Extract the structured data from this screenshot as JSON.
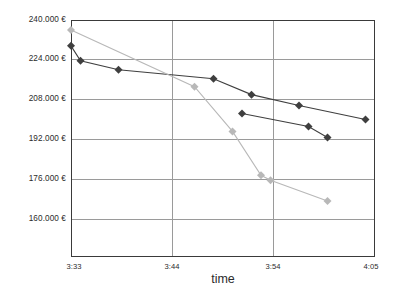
{
  "chart_data": {
    "type": "line",
    "title": "",
    "xlabel": "time",
    "ylabel": "",
    "grid": true,
    "legend": "none",
    "x_tick_labels": [
      "3:33",
      "3:44",
      "3:54",
      "4:05"
    ],
    "y_tick_labels": [
      "240.000 €",
      "224.000 €",
      "208.000 €",
      "192.000 €",
      "176.000 €",
      "160.000 €"
    ],
    "y_tick_values": [
      240000,
      224000,
      208000,
      192000,
      176000,
      160000
    ],
    "ylim": [
      160000,
      240000
    ],
    "xlim": [
      "3:33",
      "4:05"
    ],
    "currency_symbol": "€",
    "series": [
      {
        "name": "series-1-dark-upper",
        "color": "#3f3f3f",
        "marker": "diamond",
        "points": [
          {
            "x": "3:33",
            "y": 229600
          },
          {
            "x": "3:34",
            "y": 223600
          },
          {
            "x": "3:38",
            "y": 220000
          },
          {
            "x": "3:48",
            "y": 216400
          },
          {
            "x": "3:52",
            "y": 210000
          },
          {
            "x": "3:57",
            "y": 205600
          },
          {
            "x": "4:04",
            "y": 200000
          }
        ]
      },
      {
        "name": "series-2-dark-lower",
        "color": "#3f3f3f",
        "marker": "diamond",
        "points": [
          {
            "x": "3:51",
            "y": 202400
          },
          {
            "x": "3:58",
            "y": 197200
          },
          {
            "x": "4:00",
            "y": 192800
          }
        ]
      },
      {
        "name": "series-3-light",
        "color": "#b8b8b8",
        "marker": "diamond",
        "points": [
          {
            "x": "3:33",
            "y": 236000
          },
          {
            "x": "3:46",
            "y": 213200
          },
          {
            "x": "3:50",
            "y": 195200
          },
          {
            "x": "3:53",
            "y": 177600
          },
          {
            "x": "3:54",
            "y": 175600
          },
          {
            "x": "4:00",
            "y": 167200
          }
        ]
      }
    ]
  },
  "axes": {
    "x_title": "time"
  }
}
